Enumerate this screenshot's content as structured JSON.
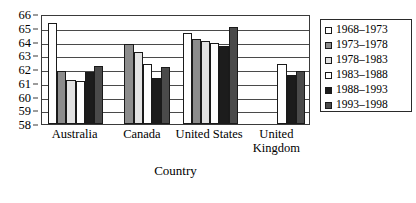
{
  "chart_data": {
    "type": "bar",
    "title": "",
    "xlabel": "Country",
    "ylabel": "",
    "ylim": [
      58,
      66
    ],
    "ytick_step": 1,
    "yticks": [
      66,
      65,
      64,
      63,
      62,
      61,
      60,
      59,
      58
    ],
    "grid": true,
    "legend_position": "right",
    "categories": [
      "Australia",
      "Canada",
      "United States",
      "United Kingdom"
    ],
    "series": [
      {
        "name": "1968–1973",
        "color": "#ffffff",
        "values": [
          65.35,
          null,
          64.6,
          null
        ]
      },
      {
        "name": "1973–1978",
        "color": "#8c8c8c",
        "values": [
          61.85,
          63.8,
          64.15,
          null
        ]
      },
      {
        "name": "1978–1983",
        "color": "#e2e2e2",
        "values": [
          61.2,
          63.25,
          64.05,
          null
        ]
      },
      {
        "name": "1983–1988",
        "color": "#ffffff",
        "values": [
          61.15,
          62.35,
          63.9,
          62.35
        ]
      },
      {
        "name": "1988–1993",
        "color": "#1c1c1c",
        "values": [
          61.8,
          61.35,
          63.65,
          61.6
        ]
      },
      {
        "name": "1993–1998",
        "color": "#4a4a4a",
        "values": [
          62.25,
          62.15,
          65.05,
          61.85
        ]
      }
    ]
  },
  "legend": {
    "items": [
      {
        "label": "1968–1973"
      },
      {
        "label": "1973–1978"
      },
      {
        "label": "1978–1983"
      },
      {
        "label": "1983–1988"
      },
      {
        "label": "1988–1993"
      },
      {
        "label": "1993–1998"
      }
    ]
  },
  "axes": {
    "x_title": "Country",
    "y_tick_labels": [
      "66",
      "65",
      "64",
      "63",
      "62",
      "61",
      "60",
      "59",
      "58"
    ],
    "category_labels": [
      "Australia",
      "Canada",
      "United States",
      "United Kingdom"
    ]
  }
}
